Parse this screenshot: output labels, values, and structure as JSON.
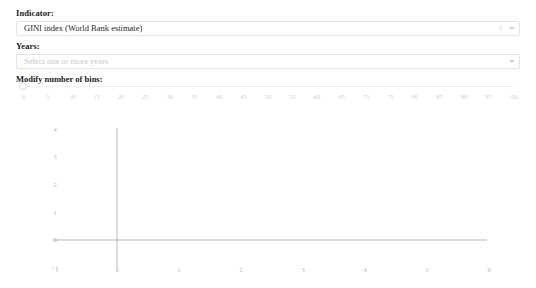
{
  "form": {
    "indicator": {
      "label": "Indicator:",
      "value": "GINI index (World Bank estimate)",
      "clear_icon": "clear-icon",
      "caret_icon": "chevron-down-icon"
    },
    "years": {
      "label": "Years:",
      "placeholder": "Select one or more years",
      "value": "",
      "caret_icon": "chevron-down-icon"
    },
    "bins": {
      "label": "Modify number of bins:",
      "value": 0,
      "min": 0,
      "max": 100,
      "step": 5,
      "ticks": [
        0,
        5,
        10,
        15,
        20,
        25,
        30,
        35,
        40,
        45,
        50,
        55,
        60,
        65,
        70,
        75,
        80,
        85,
        90,
        95,
        100
      ]
    }
  },
  "chart_data": {
    "type": "bar",
    "title": "",
    "xlabel": "",
    "ylabel": "",
    "categories": [],
    "values": [],
    "x_ticks": [
      -1,
      0,
      1,
      2,
      3,
      4,
      5,
      6
    ],
    "y_ticks": [
      -1,
      0,
      1,
      2,
      3,
      4
    ],
    "xlim": [
      -1,
      6
    ],
    "ylim": [
      -1,
      4
    ],
    "grid": false,
    "legend": "none",
    "empty": true
  },
  "colors": {
    "axis": "#9a9a9a",
    "tick_text": "#b9b9b9",
    "border": "#e2e2e2",
    "placeholder": "#c8c8c8",
    "text": "#1f1f1f",
    "background": "#ffffff"
  }
}
